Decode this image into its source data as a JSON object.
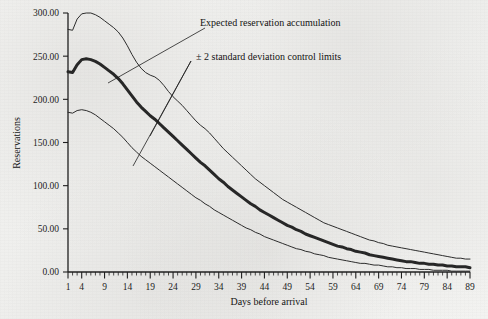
{
  "chart_data": {
    "type": "line",
    "title": "",
    "xlabel": "Days before arrival",
    "ylabel": "Reservations",
    "xlim": [
      1,
      89
    ],
    "ylim": [
      0,
      300
    ],
    "grid": false,
    "legend_position": "inline-annotations",
    "y_ticks": [
      "0.00",
      "50.00",
      "100.00",
      "150.00",
      "200.00",
      "250.00",
      "300.00"
    ],
    "y_tick_values": [
      0,
      50,
      100,
      150,
      200,
      250,
      300
    ],
    "x_ticks": [
      "1",
      "4",
      "9",
      "14",
      "19",
      "24",
      "29",
      "34",
      "39",
      "44",
      "49",
      "54",
      "59",
      "64",
      "69",
      "74",
      "79",
      "84",
      "89"
    ],
    "x_tick_values": [
      1,
      4,
      9,
      14,
      19,
      24,
      29,
      34,
      39,
      44,
      49,
      54,
      59,
      64,
      69,
      74,
      79,
      84,
      89
    ],
    "x_minor_tick_interval": 1,
    "annotations": [
      {
        "name": "expected-reservation-accumulation",
        "text": "Expected reservation accumulation",
        "points_to": "expected"
      },
      {
        "name": "control-limits",
        "text": "± 2 standard deviation control limits",
        "points_to": [
          "upper_control_limit",
          "lower_control_limit"
        ]
      }
    ],
    "x": [
      1,
      2,
      3,
      4,
      5,
      6,
      7,
      8,
      9,
      10,
      11,
      12,
      13,
      14,
      15,
      16,
      17,
      18,
      19,
      20,
      21,
      22,
      23,
      24,
      25,
      26,
      27,
      28,
      29,
      30,
      31,
      32,
      33,
      34,
      35,
      36,
      37,
      38,
      39,
      40,
      41,
      42,
      43,
      44,
      45,
      46,
      47,
      48,
      49,
      50,
      51,
      52,
      53,
      54,
      55,
      56,
      57,
      58,
      59,
      60,
      61,
      62,
      63,
      64,
      65,
      66,
      67,
      68,
      69,
      70,
      71,
      72,
      73,
      74,
      75,
      76,
      77,
      78,
      79,
      80,
      81,
      82,
      83,
      84,
      85,
      86,
      87,
      88,
      89
    ],
    "series": [
      {
        "name": "upper_control_limit",
        "label": "+2 standard deviation control limit",
        "color": "#2b2b2b",
        "line_width": 1,
        "values": [
          281,
          280,
          293,
          299,
          300,
          300,
          298,
          295,
          291,
          287,
          283,
          278,
          271,
          262,
          252,
          243,
          236,
          231,
          228,
          226,
          222,
          216,
          209,
          203,
          198,
          193,
          187,
          181,
          175,
          170,
          166,
          161,
          155,
          149,
          143,
          138,
          133,
          128,
          123,
          118,
          113,
          108,
          104,
          100,
          96,
          92,
          88,
          84,
          81,
          78,
          75,
          72,
          69,
          66,
          63,
          60,
          57,
          55,
          53,
          51,
          49,
          47,
          45,
          43,
          41,
          39,
          37,
          36,
          34,
          33,
          31,
          30,
          29,
          28,
          27,
          26,
          25,
          24,
          23,
          22,
          21,
          20,
          19,
          18,
          17,
          16,
          16,
          15,
          15
        ]
      },
      {
        "name": "expected",
        "label": "Expected reservation accumulation",
        "color": "#262626",
        "line_width": 3,
        "values": [
          232,
          231,
          240,
          246,
          247,
          246,
          244,
          241,
          237,
          233,
          229,
          224,
          218,
          211,
          204,
          197,
          191,
          186,
          181,
          177,
          172,
          167,
          162,
          157,
          152,
          147,
          142,
          137,
          132,
          127,
          123,
          118,
          113,
          108,
          104,
          99,
          95,
          91,
          87,
          83,
          79,
          76,
          72,
          69,
          66,
          63,
          60,
          57,
          54,
          52,
          49,
          47,
          44,
          42,
          40,
          38,
          36,
          34,
          32,
          30,
          29,
          27,
          26,
          24,
          23,
          22,
          20,
          19,
          18,
          17,
          16,
          15,
          14,
          13,
          12,
          12,
          11,
          10,
          10,
          9,
          9,
          8,
          8,
          7,
          7,
          6,
          6,
          6,
          5
        ]
      },
      {
        "name": "lower_control_limit",
        "label": "-2 standard deviation control limit",
        "color": "#2b2b2b",
        "line_width": 1,
        "values": [
          185,
          184,
          187,
          188,
          187,
          185,
          182,
          178,
          174,
          170,
          166,
          161,
          156,
          150,
          144,
          139,
          134,
          130,
          126,
          122,
          118,
          114,
          110,
          106,
          102,
          98,
          94,
          90,
          86,
          83,
          79,
          76,
          72,
          69,
          66,
          63,
          60,
          57,
          54,
          51,
          49,
          46,
          44,
          41,
          39,
          37,
          35,
          33,
          31,
          29,
          27,
          26,
          24,
          23,
          21,
          20,
          19,
          17,
          16,
          15,
          14,
          13,
          12,
          11,
          10,
          10,
          9,
          8,
          8,
          7,
          6,
          6,
          5,
          5,
          4,
          4,
          4,
          3,
          3,
          3,
          2,
          2,
          2,
          2,
          1,
          1,
          1,
          1,
          1
        ]
      }
    ]
  }
}
